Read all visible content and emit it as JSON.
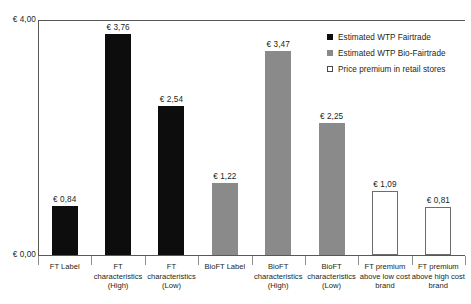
{
  "chart_data": {
    "type": "bar",
    "title": "",
    "xlabel": "",
    "ylabel": "",
    "ylim": [
      0,
      4
    ],
    "grid": false,
    "legend_position": "top-right",
    "y_ticks": [
      "€ 0,00",
      "€ 4,00"
    ],
    "categories": [
      "FT Label",
      "FT characteristics (High)",
      "FT characteristics (Low)",
      "BioFT Label",
      "BioFT characteristics (High)",
      "BioFT characteristics (Low)",
      "FT premium above low cost brand",
      "FT premium above high cost brand"
    ],
    "category_lines": [
      [
        "FT Label"
      ],
      [
        "FT",
        "characteristics",
        "(High)"
      ],
      [
        "FT",
        "characteristics",
        "(Low)"
      ],
      [
        "BioFT Label"
      ],
      [
        "BioFT",
        "characteristics",
        "(High)"
      ],
      [
        "BioFT",
        "characteristics",
        "(Low)"
      ],
      [
        "FT premium",
        "above low cost",
        "brand"
      ],
      [
        "FT premium",
        "above high cost",
        "brand"
      ]
    ],
    "values": [
      0.84,
      3.76,
      2.54,
      1.22,
      3.47,
      2.25,
      1.09,
      0.81
    ],
    "value_labels": [
      "€ 0,84",
      "€ 3,76",
      "€ 2,54",
      "€ 1,22",
      "€ 3,47",
      "€ 2,25",
      "€ 1,09",
      "€ 0,81"
    ],
    "series_of_bar": [
      "fairtrade",
      "fairtrade",
      "fairtrade",
      "bio-fairtrade",
      "bio-fairtrade",
      "bio-fairtrade",
      "premium",
      "premium"
    ],
    "series": [
      {
        "name": "Estimated WTP Fairtrade",
        "color": "#0d0d0d",
        "key": "fairtrade"
      },
      {
        "name": "Estimated WTP Bio-Fairtrade",
        "color": "#8a8a8a",
        "key": "bio-fairtrade"
      },
      {
        "name": "Price premium in retail stores",
        "color": "#ffffff",
        "key": "premium"
      }
    ]
  },
  "legend": {
    "items": [
      {
        "label": "Estimated WTP Fairtrade",
        "swatch": "black"
      },
      {
        "label": "Estimated WTP Bio-Fairtrade",
        "swatch": "gray"
      },
      {
        "label": "Price premium in retail stores",
        "swatch": "white"
      }
    ]
  },
  "colors": {
    "fairtrade": "#0d0d0d",
    "bio_fairtrade": "#8a8a8a",
    "premium_fill": "#ffffff",
    "premium_stroke": "#6d6d6f",
    "axis": "#58585a",
    "text": "#231f20"
  }
}
